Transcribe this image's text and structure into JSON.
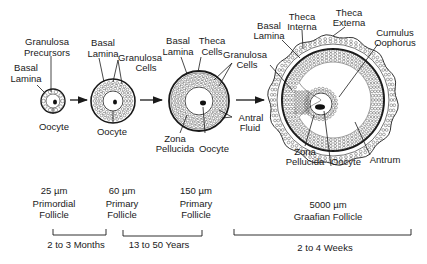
{
  "stages": [
    {
      "id": "primordial",
      "size": "25 µm",
      "name_line1": "Primordial",
      "name_line2": "Follicle",
      "labels": {
        "basal_lamina": [
          "Basal",
          "Lamina"
        ],
        "granulosa_precursors": [
          "Granulosa",
          "Precursors"
        ],
        "oocyte": "Oocyte"
      }
    },
    {
      "id": "primary-60",
      "size": "60 µm",
      "name_line1": "Primary",
      "name_line2": "Follicle",
      "labels": {
        "basal_lamina": [
          "Basal",
          "Lamina"
        ],
        "granulosa_cells": [
          "Granulosa",
          "Cells"
        ],
        "oocyte": "Oocyte"
      }
    },
    {
      "id": "primary-150",
      "size": "150 µm",
      "name_line1": "Primary",
      "name_line2": "Follicle",
      "labels": {
        "basal_lamina": [
          "Basal",
          "Lamina"
        ],
        "theca_cells": [
          "Theca",
          "Cells"
        ],
        "granulosa_cells": [
          "Granulosa",
          "Cells"
        ],
        "antral_fluid": [
          "Antral",
          "Fluid"
        ],
        "zona_pellucida": [
          "Zona",
          "Pellucida"
        ],
        "oocyte": "Oocyte"
      }
    },
    {
      "id": "graafian",
      "size": "5000 µm",
      "name_line1": "Graafian Follicle",
      "labels": {
        "basal_lamina": [
          "Basal",
          "Lamina"
        ],
        "theca_interna": [
          "Theca",
          "Interna"
        ],
        "theca_externa": [
          "Theca",
          "Externa"
        ],
        "cumulus_oophorus": [
          "Cumulus",
          "Oophorus"
        ],
        "zona_pellucida": [
          "Zona",
          "Pellucida"
        ],
        "oocyte": "Oocyte",
        "antrum": "Antrum"
      }
    }
  ],
  "durations": [
    {
      "label": "2 to 3 Months"
    },
    {
      "label": "13 to 50 Years"
    },
    {
      "label": "2 to 4 Weeks"
    }
  ],
  "colors": {
    "ink": "#1a1a1a",
    "background": "#ffffff"
  }
}
